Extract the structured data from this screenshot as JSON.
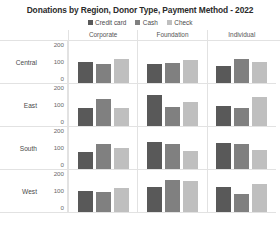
{
  "chart_data": {
    "type": "bar",
    "xlabel": "",
    "ylabel": "",
    "ylim": [
      0,
      230
    ],
    "yticks": [
      0,
      100,
      200
    ],
    "grid": false,
    "legend_position": "top-center",
    "facet_columns": [
      "Corporate",
      "Foundation",
      "Individual"
    ],
    "facet_rows": [
      "Central",
      "East",
      "South",
      "West"
    ],
    "categories": [
      "Corporate",
      "Foundation",
      "Individual"
    ],
    "series": [
      {
        "name": "Credit card",
        "color": "#595959",
        "values_by_row": {
          "Central": [
            130,
            118,
            105
          ],
          "East": [
            110,
            190,
            120
          ],
          "South": [
            100,
            163,
            160
          ],
          "West": [
            128,
            150,
            152
          ]
        }
      },
      {
        "name": "Cash",
        "color": "#808080",
        "values_by_row": {
          "Central": [
            115,
            120,
            145
          ],
          "East": [
            165,
            118,
            108
          ],
          "South": [
            152,
            150,
            152
          ],
          "West": [
            122,
            195,
            110
          ]
        }
      },
      {
        "name": "Check",
        "color": "#bfbfbf",
        "values_by_row": {
          "Central": [
            145,
            140,
            125
          ],
          "East": [
            112,
            148,
            175
          ],
          "South": [
            125,
            108,
            115
          ],
          "West": [
            145,
            190,
            172
          ]
        }
      }
    ]
  },
  "title": {
    "text": "Donations by Region, Donor Type, Payment Method - 2022"
  },
  "legend": {
    "items": [
      {
        "label": "Credit card",
        "color": "#595959"
      },
      {
        "label": "Cash",
        "color": "#808080"
      },
      {
        "label": "Check",
        "color": "#bfbfbf"
      }
    ]
  },
  "columns": [
    {
      "label": "Corporate"
    },
    {
      "label": "Foundation"
    },
    {
      "label": "Individual"
    }
  ],
  "rows": [
    {
      "label": "Central",
      "ticks": {
        "top": "200",
        "mid": "100",
        "bottom": "0"
      },
      "cells": [
        {
          "bars": [
            {
              "series": "Credit card",
              "value": 130
            },
            {
              "series": "Cash",
              "value": 115
            },
            {
              "series": "Check",
              "value": 145
            }
          ]
        },
        {
          "bars": [
            {
              "series": "Credit card",
              "value": 118
            },
            {
              "series": "Cash",
              "value": 120
            },
            {
              "series": "Check",
              "value": 140
            }
          ]
        },
        {
          "bars": [
            {
              "series": "Credit card",
              "value": 105
            },
            {
              "series": "Cash",
              "value": 145
            },
            {
              "series": "Check",
              "value": 125
            }
          ]
        }
      ]
    },
    {
      "label": "East",
      "ticks": {
        "top": "200",
        "mid": "100",
        "bottom": "0"
      },
      "cells": [
        {
          "bars": [
            {
              "series": "Credit card",
              "value": 110
            },
            {
              "series": "Cash",
              "value": 165
            },
            {
              "series": "Check",
              "value": 112
            }
          ]
        },
        {
          "bars": [
            {
              "series": "Credit card",
              "value": 190
            },
            {
              "series": "Cash",
              "value": 118
            },
            {
              "series": "Check",
              "value": 148
            }
          ]
        },
        {
          "bars": [
            {
              "series": "Credit card",
              "value": 120
            },
            {
              "series": "Cash",
              "value": 108
            },
            {
              "series": "Check",
              "value": 175
            }
          ]
        }
      ]
    },
    {
      "label": "South",
      "ticks": {
        "top": "200",
        "mid": "100",
        "bottom": "0"
      },
      "cells": [
        {
          "bars": [
            {
              "series": "Credit card",
              "value": 100
            },
            {
              "series": "Cash",
              "value": 152
            },
            {
              "series": "Check",
              "value": 125
            }
          ]
        },
        {
          "bars": [
            {
              "series": "Credit card",
              "value": 163
            },
            {
              "series": "Cash",
              "value": 150
            },
            {
              "series": "Check",
              "value": 108
            }
          ]
        },
        {
          "bars": [
            {
              "series": "Credit card",
              "value": 160
            },
            {
              "series": "Cash",
              "value": 152
            },
            {
              "series": "Check",
              "value": 115
            }
          ]
        }
      ]
    },
    {
      "label": "West",
      "ticks": {
        "top": "200",
        "mid": "100",
        "bottom": "0"
      },
      "cells": [
        {
          "bars": [
            {
              "series": "Credit card",
              "value": 128
            },
            {
              "series": "Cash",
              "value": 122
            },
            {
              "series": "Check",
              "value": 145
            }
          ]
        },
        {
          "bars": [
            {
              "series": "Credit card",
              "value": 150
            },
            {
              "series": "Cash",
              "value": 195
            },
            {
              "series": "Check",
              "value": 190
            }
          ]
        },
        {
          "bars": [
            {
              "series": "Credit card",
              "value": 152
            },
            {
              "series": "Cash",
              "value": 110
            },
            {
              "series": "Check",
              "value": 172
            }
          ]
        }
      ]
    }
  ],
  "style": {
    "panel_border": "#e2e2e2",
    "axis_text": "#6a6a6a",
    "plot_height_px": 38,
    "value_max": 230
  }
}
